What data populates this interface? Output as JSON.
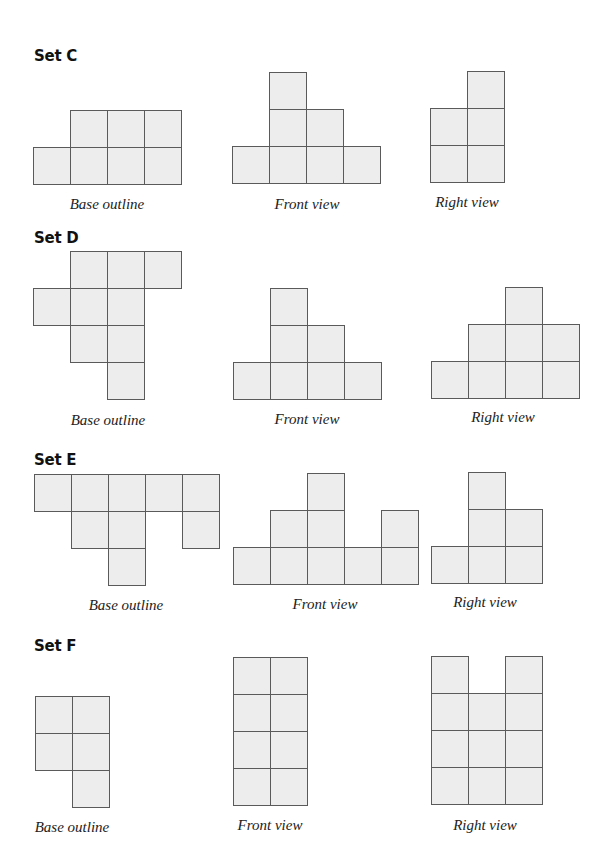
{
  "cell_size": 37,
  "colors": {
    "cell_fill": "#ededed",
    "cell_border": "#5a5a5a",
    "title": "#111111"
  },
  "sets": [
    {
      "title": "Set C",
      "title_pos": [
        34,
        47
      ],
      "figures": [
        {
          "kind": "base",
          "label": "Base outline",
          "origin": [
            33,
            110
          ],
          "label_pos": [
            107,
            196
          ],
          "cells": [
            [
              1,
              0
            ],
            [
              2,
              0
            ],
            [
              3,
              0
            ],
            [
              0,
              1
            ],
            [
              1,
              1
            ],
            [
              2,
              1
            ],
            [
              3,
              1
            ]
          ]
        },
        {
          "kind": "front",
          "label": "Front view",
          "origin": [
            232,
            72
          ],
          "label_pos": [
            307,
            196
          ],
          "cells": [
            [
              1,
              0
            ],
            [
              1,
              1
            ],
            [
              2,
              1
            ],
            [
              0,
              2
            ],
            [
              1,
              2
            ],
            [
              2,
              2
            ],
            [
              3,
              2
            ]
          ]
        },
        {
          "kind": "right",
          "label": "Right view",
          "origin": [
            430,
            71
          ],
          "label_pos": [
            467,
            194
          ],
          "cells": [
            [
              1,
              0
            ],
            [
              0,
              1
            ],
            [
              1,
              1
            ],
            [
              0,
              2
            ],
            [
              1,
              2
            ]
          ]
        }
      ]
    },
    {
      "title": "Set D",
      "title_pos": [
        34,
        229
      ],
      "figures": [
        {
          "kind": "base",
          "label": "Base outline",
          "origin": [
            33,
            251
          ],
          "label_pos": [
            108,
            412
          ],
          "cells": [
            [
              1,
              0
            ],
            [
              2,
              0
            ],
            [
              3,
              0
            ],
            [
              0,
              1
            ],
            [
              1,
              1
            ],
            [
              2,
              1
            ],
            [
              1,
              2
            ],
            [
              2,
              2
            ],
            [
              2,
              3
            ]
          ]
        },
        {
          "kind": "front",
          "label": "Front view",
          "origin": [
            233,
            288
          ],
          "label_pos": [
            307,
            411
          ],
          "cells": [
            [
              1,
              0
            ],
            [
              1,
              1
            ],
            [
              2,
              1
            ],
            [
              0,
              2
            ],
            [
              1,
              2
            ],
            [
              2,
              2
            ],
            [
              3,
              2
            ]
          ]
        },
        {
          "kind": "right",
          "label": "Right view",
          "origin": [
            431,
            287
          ],
          "label_pos": [
            503,
            409
          ],
          "cells": [
            [
              2,
              0
            ],
            [
              1,
              1
            ],
            [
              2,
              1
            ],
            [
              3,
              1
            ],
            [
              0,
              2
            ],
            [
              1,
              2
            ],
            [
              2,
              2
            ],
            [
              3,
              2
            ]
          ]
        }
      ]
    },
    {
      "title": "Set E",
      "title_pos": [
        34,
        451
      ],
      "figures": [
        {
          "kind": "base",
          "label": "Base outline",
          "origin": [
            34,
            474
          ],
          "label_pos": [
            126,
            597
          ],
          "cells": [
            [
              0,
              0
            ],
            [
              1,
              0
            ],
            [
              2,
              0
            ],
            [
              3,
              0
            ],
            [
              4,
              0
            ],
            [
              1,
              1
            ],
            [
              2,
              1
            ],
            [
              4,
              1
            ],
            [
              2,
              2
            ]
          ]
        },
        {
          "kind": "front",
          "label": "Front view",
          "origin": [
            233,
            473
          ],
          "label_pos": [
            325,
            596
          ],
          "cells": [
            [
              2,
              0
            ],
            [
              1,
              1
            ],
            [
              2,
              1
            ],
            [
              4,
              1
            ],
            [
              0,
              2
            ],
            [
              1,
              2
            ],
            [
              2,
              2
            ],
            [
              3,
              2
            ],
            [
              4,
              2
            ]
          ]
        },
        {
          "kind": "right",
          "label": "Right view",
          "origin": [
            431,
            472
          ],
          "label_pos": [
            485,
            594
          ],
          "cells": [
            [
              1,
              0
            ],
            [
              1,
              1
            ],
            [
              2,
              1
            ],
            [
              0,
              2
            ],
            [
              1,
              2
            ],
            [
              2,
              2
            ]
          ]
        }
      ]
    },
    {
      "title": "Set F",
      "title_pos": [
        34,
        637
      ],
      "figures": [
        {
          "kind": "base",
          "label": "Base outline",
          "origin": [
            35,
            696
          ],
          "label_pos": [
            72,
            819
          ],
          "cells": [
            [
              0,
              0
            ],
            [
              1,
              0
            ],
            [
              0,
              1
            ],
            [
              1,
              1
            ],
            [
              1,
              2
            ]
          ]
        },
        {
          "kind": "front",
          "label": "Front view",
          "origin": [
            233,
            657
          ],
          "label_pos": [
            270,
            817
          ],
          "cells": [
            [
              0,
              0
            ],
            [
              1,
              0
            ],
            [
              0,
              1
            ],
            [
              1,
              1
            ],
            [
              0,
              2
            ],
            [
              1,
              2
            ],
            [
              0,
              3
            ],
            [
              1,
              3
            ]
          ]
        },
        {
          "kind": "right",
          "label": "Right view",
          "origin": [
            431,
            656
          ],
          "label_pos": [
            485,
            817
          ],
          "cells": [
            [
              0,
              0
            ],
            [
              2,
              0
            ],
            [
              0,
              1
            ],
            [
              1,
              1
            ],
            [
              2,
              1
            ],
            [
              0,
              2
            ],
            [
              1,
              2
            ],
            [
              2,
              2
            ],
            [
              0,
              3
            ],
            [
              1,
              3
            ],
            [
              2,
              3
            ]
          ]
        }
      ]
    }
  ]
}
